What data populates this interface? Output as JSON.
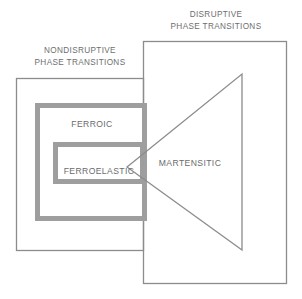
{
  "diagram": {
    "title_visible": false,
    "type": "venn-overlap-diagram",
    "background_color": "#ffffff",
    "line_color_thin": "#8c8c8c",
    "line_color_thick": "#9a9a9a",
    "text_color": "#6e6e6e",
    "regions": {
      "nondisruptive": {
        "label_line1": "NONDISRUPTIVE",
        "label_line2": "PHASE TRANSITIONS",
        "box": {
          "x": 16,
          "y": 78,
          "width": 128,
          "height": 173
        },
        "border_width": 1,
        "border_color": "#8c8c8c"
      },
      "disruptive": {
        "label_line1": "DISRUPTIVE",
        "label_line2": "PHASE TRANSITIONS",
        "box": {
          "x": 143,
          "y": 41,
          "width": 144,
          "height": 243
        },
        "border_width": 1,
        "border_color": "#8c8c8c"
      },
      "ferroic": {
        "label": "FERROIC",
        "box": {
          "x": 35,
          "y": 103,
          "width": 110,
          "height": 117
        },
        "border_width": 5,
        "border_color": "#9e9e9e"
      },
      "ferroelastic": {
        "label": "FERROELASTIC",
        "box": {
          "x": 53,
          "y": 142,
          "width": 90,
          "height": 41
        },
        "border_width": 5,
        "border_color": "#9e9e9e"
      },
      "martensitic": {
        "label": "MARTENSITIC",
        "shape": "triangle",
        "apex": {
          "x": 127,
          "y": 167
        },
        "top_right": {
          "x": 242,
          "y": 74
        },
        "bottom_right": {
          "x": 242,
          "y": 250
        },
        "border_width": 1,
        "border_color": "#8c8c8c"
      }
    },
    "label_positions": {
      "nondisruptive_line1": {
        "x": 80,
        "y": 50
      },
      "nondisruptive_line2": {
        "x": 80,
        "y": 62
      },
      "disruptive_line1": {
        "x": 215,
        "y": 16
      },
      "disruptive_line2": {
        "x": 215,
        "y": 28
      },
      "ferroic": {
        "x": 92,
        "y": 125
      },
      "ferroelastic": {
        "x": 98,
        "y": 172
      },
      "martensitic": {
        "x": 190,
        "y": 164
      }
    }
  }
}
